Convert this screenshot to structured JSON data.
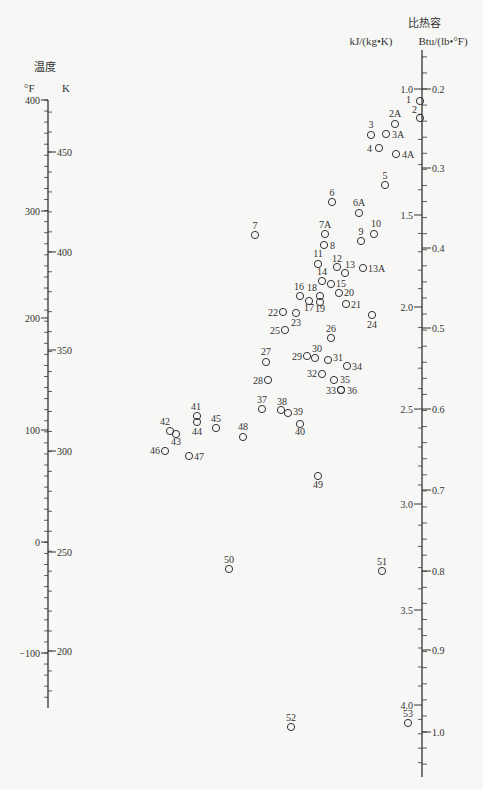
{
  "left_axis": {
    "title": "温度",
    "unit_left": "°F",
    "unit_right": "K",
    "x": 48,
    "f_ticks": [
      {
        "label": "400",
        "y": 100
      },
      {
        "label": "300",
        "y": 211
      },
      {
        "label": "200",
        "y": 318
      },
      {
        "label": "100",
        "y": 430
      },
      {
        "label": "0",
        "y": 542
      },
      {
        "label": "−100",
        "y": 653
      }
    ],
    "k_ticks": [
      {
        "label": "450",
        "y": 152
      },
      {
        "label": "400",
        "y": 252
      },
      {
        "label": "350",
        "y": 350
      },
      {
        "label": "300",
        "y": 451
      },
      {
        "label": "250",
        "y": 552
      },
      {
        "label": "200",
        "y": 651
      }
    ],
    "y_top": 100,
    "y_bottom": 708
  },
  "right_axis": {
    "title": "比热容",
    "unit_left": "kJ/(kg•K)",
    "unit_right": "Btu/(lb•°F)",
    "x": 422,
    "kj_ticks": [
      {
        "label": "1.0",
        "y": 89
      },
      {
        "label": "1.5",
        "y": 215
      },
      {
        "label": "2.0",
        "y": 307
      },
      {
        "label": "2.5",
        "y": 409
      },
      {
        "label": "3.0",
        "y": 504
      },
      {
        "label": "3.5",
        "y": 610
      },
      {
        "label": "4.0",
        "y": 705
      }
    ],
    "btu_ticks": [
      {
        "label": "0.2",
        "y": 89
      },
      {
        "label": "0.3",
        "y": 168
      },
      {
        "label": "0.4",
        "y": 248
      },
      {
        "label": "0.5",
        "y": 328
      },
      {
        "label": "0.6",
        "y": 409
      },
      {
        "label": "0.7",
        "y": 490
      },
      {
        "label": "0.8",
        "y": 571
      },
      {
        "label": "0.9",
        "y": 650
      },
      {
        "label": "1.0",
        "y": 732
      }
    ],
    "y_top": 50,
    "y_bottom": 777
  },
  "chart_data": {
    "type": "scatter",
    "xlabel": "",
    "ylabel": "温度 (°F / K) ; 比热容 kJ/(kg·K) / Btu/(lb·°F)",
    "legend": [],
    "points": [
      {
        "id": "1",
        "x": 420,
        "y": 101,
        "lx": 411,
        "ly": 103,
        "anchor": "end"
      },
      {
        "id": "2",
        "x": 420,
        "y": 118,
        "lx": 417,
        "ly": 113,
        "anchor": "end"
      },
      {
        "id": "2A",
        "x": 395,
        "y": 124,
        "lx": 395,
        "ly": 117,
        "anchor": "middle"
      },
      {
        "id": "3",
        "x": 371,
        "y": 135,
        "lx": 371,
        "ly": 128,
        "anchor": "middle"
      },
      {
        "id": "3A",
        "x": 386,
        "y": 134,
        "lx": 392,
        "ly": 138,
        "anchor": "start"
      },
      {
        "id": "4",
        "x": 379,
        "y": 148,
        "lx": 372,
        "ly": 152,
        "anchor": "end"
      },
      {
        "id": "4A",
        "x": 396,
        "y": 154,
        "lx": 402,
        "ly": 158,
        "anchor": "start"
      },
      {
        "id": "5",
        "x": 385,
        "y": 185,
        "lx": 385,
        "ly": 179,
        "anchor": "middle"
      },
      {
        "id": "6",
        "x": 332,
        "y": 202,
        "lx": 332,
        "ly": 196,
        "anchor": "middle"
      },
      {
        "id": "6A",
        "x": 359,
        "y": 213,
        "lx": 359,
        "ly": 206,
        "anchor": "middle"
      },
      {
        "id": "7",
        "x": 255,
        "y": 235,
        "lx": 255,
        "ly": 229,
        "anchor": "middle"
      },
      {
        "id": "7A",
        "x": 325,
        "y": 234,
        "lx": 325,
        "ly": 228,
        "anchor": "middle"
      },
      {
        "id": "8",
        "x": 324,
        "y": 245,
        "lx": 330,
        "ly": 249,
        "anchor": "start"
      },
      {
        "id": "9",
        "x": 361,
        "y": 241,
        "lx": 361,
        "ly": 235,
        "anchor": "middle"
      },
      {
        "id": "10",
        "x": 374,
        "y": 234,
        "lx": 376,
        "ly": 227,
        "anchor": "middle"
      },
      {
        "id": "11",
        "x": 318,
        "y": 264,
        "lx": 318,
        "ly": 257,
        "anchor": "middle"
      },
      {
        "id": "12",
        "x": 337,
        "y": 267,
        "lx": 337,
        "ly": 262,
        "anchor": "middle"
      },
      {
        "id": "13",
        "x": 345,
        "y": 273,
        "lx": 350,
        "ly": 268,
        "anchor": "middle"
      },
      {
        "id": "13A",
        "x": 363,
        "y": 268,
        "lx": 368,
        "ly": 272,
        "anchor": "start"
      },
      {
        "id": "14",
        "x": 322,
        "y": 281,
        "lx": 322,
        "ly": 275,
        "anchor": "middle"
      },
      {
        "id": "15",
        "x": 331,
        "y": 284,
        "lx": 336,
        "ly": 287,
        "anchor": "start"
      },
      {
        "id": "16",
        "x": 300,
        "y": 296,
        "lx": 299,
        "ly": 290,
        "anchor": "middle"
      },
      {
        "id": "18",
        "x": 320,
        "y": 296,
        "lx": 312,
        "ly": 291,
        "anchor": "middle"
      },
      {
        "id": "17",
        "x": 309,
        "y": 301,
        "lx": 309,
        "ly": 311,
        "anchor": "middle"
      },
      {
        "id": "19",
        "x": 320,
        "y": 302,
        "lx": 320,
        "ly": 312,
        "anchor": "middle"
      },
      {
        "id": "20",
        "x": 339,
        "y": 293,
        "lx": 344,
        "ly": 296,
        "anchor": "start"
      },
      {
        "id": "21",
        "x": 346,
        "y": 304,
        "lx": 351,
        "ly": 308,
        "anchor": "start"
      },
      {
        "id": "22",
        "x": 283,
        "y": 312,
        "lx": 278,
        "ly": 316,
        "anchor": "end"
      },
      {
        "id": "23",
        "x": 296,
        "y": 313,
        "lx": 296,
        "ly": 326,
        "anchor": "middle"
      },
      {
        "id": "24",
        "x": 372,
        "y": 315,
        "lx": 372,
        "ly": 328,
        "anchor": "middle"
      },
      {
        "id": "25",
        "x": 285,
        "y": 330,
        "lx": 280,
        "ly": 334,
        "anchor": "end"
      },
      {
        "id": "26",
        "x": 331,
        "y": 338,
        "lx": 331,
        "ly": 332,
        "anchor": "middle"
      },
      {
        "id": "27",
        "x": 266,
        "y": 362,
        "lx": 266,
        "ly": 355,
        "anchor": "middle"
      },
      {
        "id": "28",
        "x": 268,
        "y": 380,
        "lx": 263,
        "ly": 384,
        "anchor": "end"
      },
      {
        "id": "29",
        "x": 307,
        "y": 356,
        "lx": 302,
        "ly": 360,
        "anchor": "end"
      },
      {
        "id": "30",
        "x": 315,
        "y": 358,
        "lx": 317,
        "ly": 352,
        "anchor": "middle"
      },
      {
        "id": "31",
        "x": 328,
        "y": 360,
        "lx": 333,
        "ly": 361,
        "anchor": "start"
      },
      {
        "id": "32",
        "x": 322,
        "y": 374,
        "lx": 317,
        "ly": 377,
        "anchor": "end"
      },
      {
        "id": "33",
        "x": 341,
        "y": 390,
        "lx": 336,
        "ly": 394,
        "anchor": "end"
      },
      {
        "id": "34",
        "x": 347,
        "y": 366,
        "lx": 352,
        "ly": 370,
        "anchor": "start"
      },
      {
        "id": "35",
        "x": 334,
        "y": 380,
        "lx": 340,
        "ly": 383,
        "anchor": "start"
      },
      {
        "id": "36",
        "x": 341,
        "y": 390,
        "lx": 347,
        "ly": 394,
        "anchor": "start"
      },
      {
        "id": "37",
        "x": 262,
        "y": 409,
        "lx": 262,
        "ly": 403,
        "anchor": "middle"
      },
      {
        "id": "38",
        "x": 281,
        "y": 410,
        "lx": 282,
        "ly": 405,
        "anchor": "middle"
      },
      {
        "id": "39",
        "x": 288,
        "y": 413,
        "lx": 293,
        "ly": 415,
        "anchor": "start"
      },
      {
        "id": "40",
        "x": 300,
        "y": 424,
        "lx": 300,
        "ly": 435,
        "anchor": "middle"
      },
      {
        "id": "41",
        "x": 197,
        "y": 416,
        "lx": 196,
        "ly": 410,
        "anchor": "middle"
      },
      {
        "id": "42",
        "x": 170,
        "y": 431,
        "lx": 165,
        "ly": 425,
        "anchor": "middle"
      },
      {
        "id": "43",
        "x": 176,
        "y": 434,
        "lx": 176,
        "ly": 445,
        "anchor": "middle"
      },
      {
        "id": "44",
        "x": 197,
        "y": 422,
        "lx": 197,
        "ly": 435,
        "anchor": "middle"
      },
      {
        "id": "45",
        "x": 216,
        "y": 428,
        "lx": 216,
        "ly": 422,
        "anchor": "middle"
      },
      {
        "id": "46",
        "x": 165,
        "y": 451,
        "lx": 160,
        "ly": 454,
        "anchor": "end"
      },
      {
        "id": "47",
        "x": 189,
        "y": 456,
        "lx": 194,
        "ly": 460,
        "anchor": "start"
      },
      {
        "id": "48",
        "x": 243,
        "y": 437,
        "lx": 243,
        "ly": 430,
        "anchor": "middle"
      },
      {
        "id": "49",
        "x": 318,
        "y": 476,
        "lx": 318,
        "ly": 488,
        "anchor": "middle"
      },
      {
        "id": "50",
        "x": 229,
        "y": 569,
        "lx": 229,
        "ly": 563,
        "anchor": "middle"
      },
      {
        "id": "51",
        "x": 382,
        "y": 571,
        "lx": 382,
        "ly": 565,
        "anchor": "middle"
      },
      {
        "id": "52",
        "x": 291,
        "y": 727,
        "lx": 291,
        "ly": 721,
        "anchor": "middle"
      },
      {
        "id": "53",
        "x": 408,
        "y": 723,
        "lx": 408,
        "ly": 717,
        "anchor": "middle"
      }
    ],
    "axes": {
      "temperature_F": {
        "range": [
          -150,
          400
        ],
        "major_ticks": [
          400,
          300,
          200,
          100,
          0,
          -100
        ]
      },
      "temperature_K": {
        "range": [
          170,
          478
        ],
        "major_ticks": [
          450,
          400,
          350,
          300,
          250,
          200
        ]
      },
      "specific_heat_kJ": {
        "range": [
          0.85,
          4.25
        ],
        "major_ticks": [
          1.0,
          1.5,
          2.0,
          2.5,
          3.0,
          3.5,
          4.0
        ]
      },
      "specific_heat_Btu": {
        "range": [
          0.15,
          1.07
        ],
        "major_ticks": [
          0.2,
          0.3,
          0.4,
          0.5,
          0.6,
          0.7,
          0.8,
          0.9,
          1.0
        ]
      }
    },
    "grid": false
  }
}
